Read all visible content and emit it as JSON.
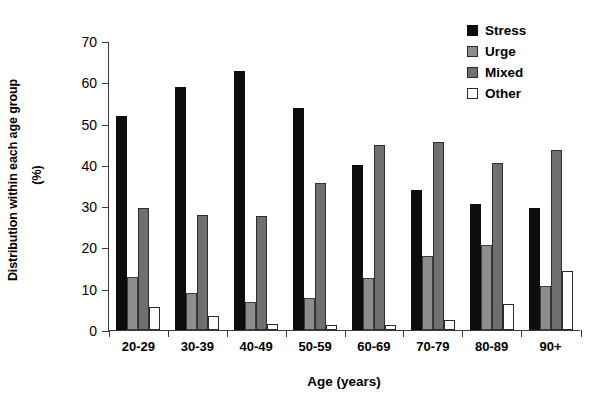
{
  "chart_data": {
    "type": "bar",
    "title": "",
    "xlabel": "Age (years)",
    "ylabel": "Distribution within each age group",
    "ylabel_unit": "(%)",
    "ylim": [
      0,
      70
    ],
    "yticks": [
      0,
      10,
      20,
      30,
      40,
      50,
      60,
      70
    ],
    "grid": false,
    "legend_position": "top-right",
    "categories": [
      "20-29",
      "30-39",
      "40-49",
      "50-59",
      "60-69",
      "70-79",
      "80-89",
      "90+"
    ],
    "series": [
      {
        "name": "Stress",
        "color": "#0d0d0d",
        "values": [
          51.9,
          58.9,
          62.7,
          53.8,
          39.9,
          33.8,
          30.6,
          29.5
        ]
      },
      {
        "name": "Urge",
        "color": "#8d8d8d",
        "values": [
          12.8,
          8.9,
          6.7,
          7.8,
          12.7,
          17.9,
          20.7,
          10.6
        ]
      },
      {
        "name": "Mixed",
        "color": "#6f6f6f",
        "values": [
          29.6,
          27.8,
          27.7,
          35.6,
          44.9,
          45.6,
          40.5,
          43.7
        ]
      },
      {
        "name": "Other",
        "color": "#ffffff",
        "values": [
          5.6,
          3.3,
          1.4,
          1.3,
          1.3,
          2.4,
          6.3,
          14.2
        ]
      }
    ]
  }
}
